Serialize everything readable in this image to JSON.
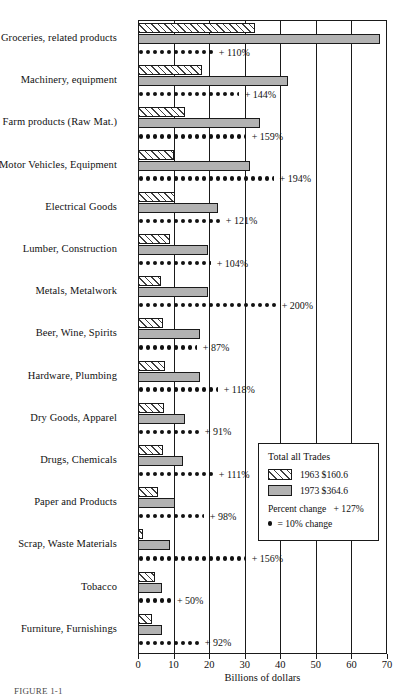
{
  "chart_data": {
    "type": "bar",
    "title": "",
    "xlabel": "Billions of dollars",
    "ylabel": "",
    "xlim": [
      0,
      70
    ],
    "xticks": [
      0,
      10,
      20,
      30,
      40,
      50,
      60,
      70
    ],
    "grid": true,
    "orientation": "horizontal",
    "legend_position": "inside-right-lower",
    "categories": [
      "Groceries, related products",
      "Machinery, equipment",
      "Farm products (Raw Mat.)",
      "Motor Vehicles, Equipment",
      "Electrical Goods",
      "Lumber, Construction",
      "Metals, Metalwork",
      "Beer, Wine, Spirits",
      "Hardware, Plumbing",
      "Dry Goods, Apparel",
      "Drugs, Chemicals",
      "Paper and Products",
      "Scrap, Waste Materials",
      "Tobacco",
      "Furniture, Furnishings"
    ],
    "series": [
      {
        "name": "1963",
        "values": [
          32.9,
          18.0,
          13.2,
          10.1,
          10.4,
          9.0,
          6.5,
          7.0,
          7.6,
          7.3,
          7.0,
          5.6,
          1.4,
          4.8,
          3.9
        ]
      },
      {
        "name": "1973",
        "values": [
          68.0,
          42.2,
          34.3,
          31.5,
          22.5,
          19.7,
          19.7,
          17.4,
          17.4,
          13.2,
          12.6,
          10.4,
          9.0,
          6.7,
          6.7
        ]
      }
    ],
    "percent_change": [
      "+ 110%",
      "+ 144%",
      "+ 159%",
      "+ 194%",
      "+ 121%",
      "+ 104%",
      "+ 200%",
      "+ 87%",
      "+ 118%",
      "+ 91%",
      "+ 111%",
      "+ 98%",
      "+ 156%",
      "+ 50%",
      "+ 92%"
    ],
    "percent_change_values": [
      110,
      144,
      159,
      194,
      121,
      104,
      200,
      87,
      118,
      91,
      111,
      98,
      156,
      50,
      92
    ],
    "dot_unit_percent": 10
  },
  "legend": {
    "title": "Total all Trades",
    "entries": [
      {
        "label": "1963 $160.6",
        "swatch": "hatch"
      },
      {
        "label": "1973 $364.6",
        "swatch": "solid"
      }
    ],
    "percent_change_label": "Percent change",
    "percent_change_value": "+ 127%",
    "dot_key": "= 10% change"
  },
  "axis": {
    "title": "Billions of dollars",
    "tick_labels": [
      "0",
      "10",
      "20",
      "30",
      "40",
      "50",
      "60",
      "70"
    ]
  },
  "caption": "FIGURE 1-1",
  "colors": {
    "bar_1973_fill": "#b2b2b2",
    "bar_1963_fill": "#ffffff",
    "line": "#1a1a1a"
  }
}
